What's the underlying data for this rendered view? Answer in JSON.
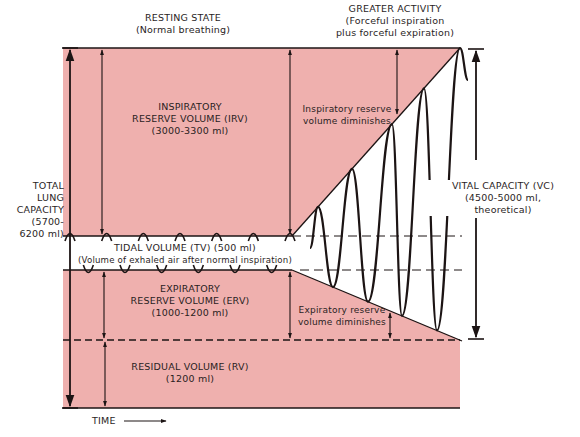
{
  "colors": {
    "volume_fill": "#efb0ae",
    "line": "#1c1414",
    "background": "#ffffff"
  },
  "headers": {
    "resting": {
      "title": "RESTING STATE",
      "subtitle": "(Normal breathing)"
    },
    "activity": {
      "title": "GREATER ACTIVITY",
      "line2": "(Forceful inspiration",
      "line3": "plus forceful expiration)"
    }
  },
  "volumes": {
    "irv": {
      "line1": "INSPIRATORY",
      "line2": "RESERVE VOLUME (IRV)",
      "line3": "(3000-3300 ml)",
      "range_ml": [
        3000,
        3300
      ]
    },
    "tv": {
      "line1": "TIDAL VOLUME (TV) (500 ml)",
      "line2": "(Volume of exhaled air after normal inspiration)",
      "value_ml": 500
    },
    "erv": {
      "line1": "EXPIRATORY",
      "line2": "RESERVE VOLUME (ERV)",
      "line3": "(1000-1200 ml)",
      "range_ml": [
        1000,
        1200
      ]
    },
    "rv": {
      "line1": "RESIDUAL VOLUME (RV)",
      "line2": "(1200 ml)",
      "value_ml": 1200
    }
  },
  "capacities": {
    "tlc": {
      "line1": "TOTAL",
      "line2": "LUNG",
      "line3": "CAPACITY",
      "line4": "(5700-",
      "line5": "6200 ml)",
      "range_ml": [
        5700,
        6200
      ]
    },
    "vc": {
      "line1": "VITAL CAPACITY (VC)",
      "line2": "(4500-5000 ml,",
      "line3": "theoretical)",
      "range_ml": [
        4500,
        5000
      ]
    }
  },
  "annotations": {
    "irv_diminishes": {
      "line1": "Inspiratory reserve",
      "line2": "volume diminishes"
    },
    "erv_diminishes": {
      "line1": "Expiratory reserve",
      "line2": "volume diminishes"
    }
  },
  "axis": {
    "time_label": "TIME"
  },
  "breathing_waves": {
    "resting_cycles": 6,
    "activity_cycles": 6
  }
}
